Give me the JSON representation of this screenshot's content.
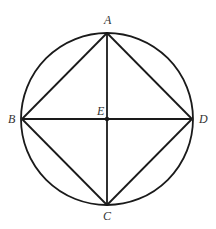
{
  "diagram": {
    "type": "geometry",
    "colors": {
      "stroke": "#1a1a1a",
      "label": "#333333",
      "background": "#ffffff"
    },
    "circle": {
      "cx": 107,
      "cy": 119,
      "r": 86
    },
    "points": {
      "A": {
        "label": "A",
        "x": 107,
        "y": 33,
        "label_x": 104,
        "label_y": 24
      },
      "B": {
        "label": "B",
        "x": 22,
        "y": 119,
        "label_x": 8,
        "label_y": 123
      },
      "C": {
        "label": "C",
        "x": 107,
        "y": 205,
        "label_x": 103,
        "label_y": 220
      },
      "D": {
        "label": "D",
        "x": 192,
        "y": 119,
        "label_x": 199,
        "label_y": 123
      },
      "E": {
        "label": "E",
        "x": 107,
        "y": 119,
        "label_x": 97,
        "label_y": 115
      }
    },
    "segments": [
      [
        "A",
        "B"
      ],
      [
        "B",
        "C"
      ],
      [
        "C",
        "D"
      ],
      [
        "D",
        "A"
      ],
      [
        "A",
        "C"
      ],
      [
        "B",
        "D"
      ]
    ]
  }
}
